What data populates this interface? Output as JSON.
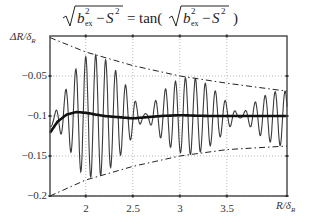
{
  "chart_data": {
    "type": "line",
    "xlabel": "R/δ_R",
    "ylabel": "ΔR/δ_R",
    "xlim": [
      1.62,
      4.14
    ],
    "ylim": [
      -0.2,
      0.0
    ],
    "xticks": [
      2,
      2.5,
      3,
      3.5
    ],
    "xtick_labels": [
      "2",
      "2.5",
      "3",
      "3.5"
    ],
    "yticks": [
      -0.05,
      -0.1,
      -0.15,
      -0.2
    ],
    "ytick_labels": [
      "-0.05",
      "-0.1",
      "-0.15",
      "-0.2"
    ],
    "grid": true,
    "legend": null,
    "series": [
      {
        "name": "oscillating ΔR/δ_R",
        "style": "thin solid gray-black",
        "period": 0.106,
        "center": -0.1,
        "beat_nodes_x": [
          2.63,
          3.64
        ],
        "peak_x_approx": [
          1.64,
          1.8,
          1.9,
          2.0,
          2.11,
          2.22,
          2.33,
          2.43
        ],
        "peak_y_approx": [
          -0.069,
          -0.069,
          -0.037,
          -0.008,
          -0.012,
          -0.018,
          -0.03,
          -0.045
        ]
      },
      {
        "name": "mean curve",
        "style": "thick solid black",
        "x": [
          1.62,
          1.7,
          1.8,
          1.9,
          2.0,
          2.2,
          2.5,
          2.8,
          3.0,
          3.3,
          3.6,
          4.0,
          4.14
        ],
        "y": [
          -0.121,
          -0.107,
          -0.098,
          -0.095,
          -0.096,
          -0.1,
          -0.103,
          -0.1,
          -0.099,
          -0.1,
          -0.1,
          -0.1,
          -0.1
        ]
      },
      {
        "name": "upper envelope",
        "style": "dash-dot black",
        "x": [
          1.62,
          2.0,
          2.5,
          3.0,
          3.5,
          4.14
        ],
        "y": [
          -0.002,
          -0.02,
          -0.037,
          -0.05,
          -0.059,
          -0.069
        ]
      },
      {
        "name": "lower envelope",
        "style": "dash-dot black",
        "x": [
          1.62,
          2.0,
          2.5,
          3.0,
          3.5,
          4.14
        ],
        "y": [
          -0.2,
          -0.18,
          -0.163,
          -0.15,
          -0.142,
          -0.1375
        ]
      }
    ]
  },
  "formula": {
    "lhs_radical": "b",
    "sub": "ex",
    "sup": "2",
    "minus": "−S",
    "sup2": "2",
    "equals": "=",
    "fn": "tan("
  },
  "axes": {
    "xlabel": "R/δR",
    "ylabel": "ΔR/δR"
  }
}
